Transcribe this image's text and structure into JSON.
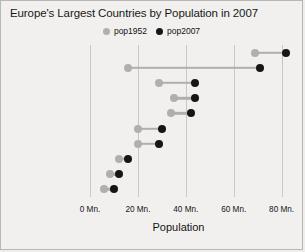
{
  "chart_data": {
    "type": "scatter",
    "title": "Europe's Largest Countries by Population in 2007",
    "xlabel": "Population",
    "ylabel": "",
    "xlim": [
      0,
      86
    ],
    "grid": true,
    "legend_position": "top-center",
    "x_ticks": [
      {
        "value": 0,
        "label": "0 Mn."
      },
      {
        "value": 20,
        "label": "20 Mn."
      },
      {
        "value": 40,
        "label": "40 Mn."
      },
      {
        "value": 60,
        "label": "60 Mn."
      },
      {
        "value": 80,
        "label": "80 Mn."
      }
    ],
    "legend": [
      {
        "name": "pop1952",
        "color": "#b0afad"
      },
      {
        "name": "pop2007",
        "color": "#161616"
      }
    ],
    "categories": [
      "Germany",
      "Turkey",
      "France",
      "United Kingdom",
      "Italy",
      "Spain",
      "Poland",
      "Romania",
      "Netherlands",
      "Greece"
    ],
    "series": [
      {
        "name": "pop1952",
        "color": "#b0afad",
        "values": [
          69,
          16,
          29,
          35,
          34,
          20,
          20,
          12,
          8.5,
          6
        ]
      },
      {
        "name": "pop2007",
        "color": "#161616",
        "values": [
          82,
          71,
          44,
          44,
          42,
          30,
          29,
          16,
          12,
          10
        ]
      }
    ]
  },
  "colors": {
    "background": "#f1f0ee",
    "border": "#b9b7b4",
    "gridline": "#c9c7c4",
    "connector": "#b2b1af",
    "pop1952": "#b0afad",
    "pop2007": "#161616"
  }
}
